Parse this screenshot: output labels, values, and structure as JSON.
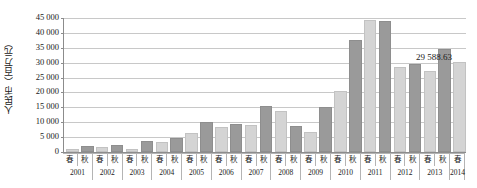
{
  "chart_data": {
    "type": "bar",
    "title": "",
    "xlabel": "",
    "ylabel": "人民币（百万元）",
    "ylim": [
      0,
      45000
    ],
    "ytick_step": 5000,
    "ytick_labels": [
      "45 000",
      "40 000",
      "35 000",
      "30 000",
      "25 000",
      "20 000",
      "15 000",
      "10 000",
      "5 000",
      "0"
    ],
    "ytick_values": [
      45000,
      40000,
      35000,
      30000,
      25000,
      20000,
      15000,
      10000,
      5000,
      0
    ],
    "grid": true,
    "legend": "none",
    "season_labels": [
      "春",
      "秋"
    ],
    "years": [
      "2001",
      "2002",
      "2003",
      "2004",
      "2005",
      "2006",
      "2007",
      "2008",
      "2009",
      "2010",
      "2011",
      "2012",
      "2013",
      "2014"
    ],
    "categories": [
      "2001春",
      "2001秋",
      "2002春",
      "2002秋",
      "2003春",
      "2003秋",
      "2004春",
      "2004秋",
      "2005春",
      "2005秋",
      "2006春",
      "2006秋",
      "2007春",
      "2007秋",
      "2008春",
      "2008秋",
      "2009春",
      "2009秋",
      "2010春",
      "2010秋",
      "2011春",
      "2011秋",
      "2012春",
      "2012秋",
      "2013春",
      "2013秋",
      "2014春"
    ],
    "bars": [
      {
        "year": "2001",
        "season": "春",
        "value": 500,
        "color": "#d4d4d4"
      },
      {
        "year": "2001",
        "season": "秋",
        "value": 1400,
        "color": "#9a9a9a"
      },
      {
        "year": "2002",
        "season": "春",
        "value": 900,
        "color": "#d4d4d4"
      },
      {
        "year": "2002",
        "season": "秋",
        "value": 1800,
        "color": "#9a9a9a"
      },
      {
        "year": "2003",
        "season": "春",
        "value": 500,
        "color": "#d4d4d4"
      },
      {
        "year": "2003",
        "season": "秋",
        "value": 3000,
        "color": "#9a9a9a"
      },
      {
        "year": "2004",
        "season": "春",
        "value": 2800,
        "color": "#d4d4d4"
      },
      {
        "year": "2004",
        "season": "秋",
        "value": 4000,
        "color": "#9a9a9a"
      },
      {
        "year": "2005",
        "season": "春",
        "value": 5800,
        "color": "#d4d4d4"
      },
      {
        "year": "2005",
        "season": "秋",
        "value": 9500,
        "color": "#9a9a9a"
      },
      {
        "year": "2006",
        "season": "春",
        "value": 7600,
        "color": "#d4d4d4"
      },
      {
        "year": "2006",
        "season": "秋",
        "value": 8800,
        "color": "#9a9a9a"
      },
      {
        "year": "2007",
        "season": "春",
        "value": 8300,
        "color": "#d4d4d4"
      },
      {
        "year": "2007",
        "season": "秋",
        "value": 14800,
        "color": "#9a9a9a"
      },
      {
        "year": "2008",
        "season": "春",
        "value": 13000,
        "color": "#d4d4d4"
      },
      {
        "year": "2008",
        "season": "秋",
        "value": 8000,
        "color": "#9a9a9a"
      },
      {
        "year": "2009",
        "season": "春",
        "value": 6200,
        "color": "#d4d4d4"
      },
      {
        "year": "2009",
        "season": "秋",
        "value": 14500,
        "color": "#9a9a9a"
      },
      {
        "year": "2010",
        "season": "春",
        "value": 19700,
        "color": "#d4d4d4"
      },
      {
        "year": "2010",
        "season": "秋",
        "value": 36800,
        "color": "#9a9a9a"
      },
      {
        "year": "2011",
        "season": "春",
        "value": 43500,
        "color": "#d4d4d4"
      },
      {
        "year": "2011",
        "season": "秋",
        "value": 43300,
        "color": "#9a9a9a"
      },
      {
        "year": "2012",
        "season": "春",
        "value": 27800,
        "color": "#d4d4d4"
      },
      {
        "year": "2012",
        "season": "秋",
        "value": 28800,
        "color": "#9a9a9a"
      },
      {
        "year": "2013",
        "season": "春",
        "value": 26600,
        "color": "#d4d4d4"
      },
      {
        "year": "2013",
        "season": "秋",
        "value": 34000,
        "color": "#9a9a9a"
      },
      {
        "year": "2014",
        "season": "春",
        "value": 29588.63,
        "color": "#d4d4d4"
      }
    ],
    "annotations": [
      {
        "text": "29 588.63",
        "target": "2014春",
        "value": 29588.63
      }
    ],
    "colors": {
      "spring_bar": "#d4d4d4",
      "autumn_bar": "#9a9a9a",
      "gridline": "#c8c8c8",
      "axis": "#8c8c8c",
      "text": "#1a1a1a",
      "background": "#ffffff"
    }
  }
}
